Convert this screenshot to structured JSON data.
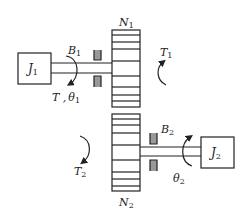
{
  "diagram": {
    "type": "gear-train mechanical system",
    "colors": {
      "line": "#222222",
      "background": "#ffffff",
      "bearing_fill": "#888888"
    },
    "components": {
      "inertia1": {
        "label": "J",
        "sub": "1"
      },
      "inertia2": {
        "label": "J",
        "sub": "2"
      },
      "gear1": {
        "label": "N",
        "sub": "1"
      },
      "gear2": {
        "label": "N",
        "sub": "2"
      },
      "damper1": {
        "label": "B",
        "sub": "1"
      },
      "damper2": {
        "label": "B",
        "sub": "2"
      }
    },
    "annotations": {
      "input_torque": {
        "label": "T",
        "sep": " ,",
        "theta": "θ",
        "theta_sub": "1"
      },
      "gear1_torque": {
        "label": "T",
        "sub": "1"
      },
      "gear2_torque": {
        "label": "T",
        "sub": "2"
      },
      "output_angle": {
        "label": "θ",
        "sub": "2"
      }
    }
  }
}
